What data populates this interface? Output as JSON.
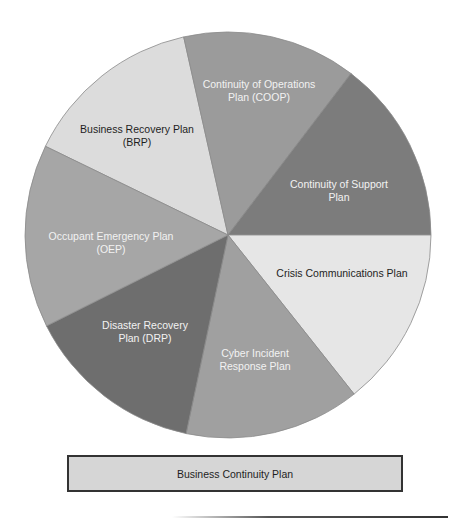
{
  "diagram": {
    "title": "Business Continuity Plan",
    "center": [
      228,
      235
    ],
    "radius": 203,
    "slices": [
      {
        "id": "brp",
        "label_lines": [
          "Business Recovery Plan",
          "(BRP)"
        ],
        "color": "#dcdcdc",
        "label_color": "dark",
        "start_deg": -154.1,
        "end_deg": -102.6,
        "label_pos": [
          137,
          133
        ]
      },
      {
        "id": "coop",
        "label_lines": [
          "Continuity of Operations",
          "Plan (COOP)"
        ],
        "color": "#9b9b9b",
        "label_color": "light",
        "start_deg": -102.6,
        "end_deg": -52.7,
        "label_pos": [
          259,
          88
        ]
      },
      {
        "id": "cos",
        "label_lines": [
          "Continuity of Support",
          "Plan"
        ],
        "color": "#7c7c7c",
        "label_color": "light",
        "start_deg": -52.7,
        "end_deg": 0,
        "label_pos": [
          339,
          188
        ]
      },
      {
        "id": "crisis",
        "label_lines": [
          "Crisis Communications Plan"
        ],
        "color": "#e6e6e6",
        "label_color": "dark",
        "start_deg": 0,
        "end_deg": 51.6,
        "label_pos": [
          342,
          277
        ]
      },
      {
        "id": "cyber",
        "label_lines": [
          "Cyber Incident",
          "Response Plan"
        ],
        "color": "#a0a0a0",
        "label_color": "light",
        "start_deg": 51.6,
        "end_deg": 101.9,
        "label_pos": [
          255,
          357
        ]
      },
      {
        "id": "drp",
        "label_lines": [
          "Disaster Recovery",
          "Plan (DRP)"
        ],
        "color": "#6e6e6e",
        "label_color": "light",
        "start_deg": 101.9,
        "end_deg": 153.4,
        "label_pos": [
          145,
          329
        ]
      },
      {
        "id": "oep",
        "label_lines": [
          "Occupant Emergency Plan",
          "(OEP)"
        ],
        "color": "#a6a6a6",
        "label_color": "light",
        "start_deg": 153.4,
        "end_deg": 205.9,
        "label_pos": [
          111,
          240
        ]
      }
    ]
  },
  "footer_box": {
    "label": "Business Continuity Plan"
  },
  "chart_data": {
    "type": "pie",
    "title": "Business Continuity Plan",
    "categories": [
      "Business Recovery Plan (BRP)",
      "Continuity of Operations Plan (COOP)",
      "Continuity of Support Plan",
      "Crisis Communications Plan",
      "Cyber Incident Response Plan",
      "Disaster Recovery Plan (DRP)",
      "Occupant Emergency Plan (OEP)"
    ],
    "values": [
      14.3,
      13.9,
      14.6,
      14.3,
      14.0,
      14.3,
      14.6
    ],
    "legend": "none (labels inside slices)",
    "note": "Seven approximately equal slices"
  }
}
